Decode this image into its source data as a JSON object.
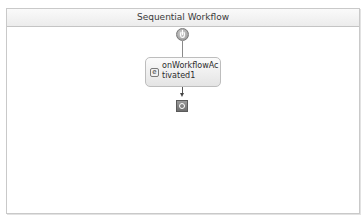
{
  "workflow": {
    "title": "Sequential Workflow",
    "start_icon": "workflow-start-icon",
    "activity": {
      "label": "onWorkflowActivated1",
      "icon": "handle-external-event-icon"
    },
    "end_icon": "workflow-end-icon"
  },
  "colors": {
    "border": "#c9c9c9",
    "header_bg": "#f0f0f0",
    "activity_bg": "#eeeeee"
  }
}
